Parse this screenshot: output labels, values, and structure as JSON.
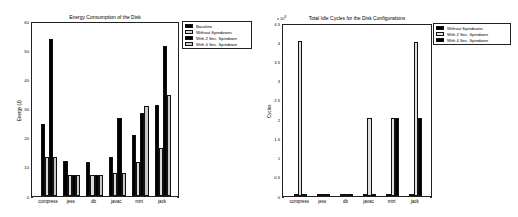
{
  "chart_data": [
    {
      "type": "bar",
      "title": "Energy Consumption of the Disk",
      "xlabel": "",
      "ylabel": "Energy (J)",
      "ylim": [
        0,
        60
      ],
      "yticks": [
        0,
        10,
        20,
        30,
        40,
        50,
        60
      ],
      "grid": false,
      "legend_position": "outside-right-top",
      "categories": [
        "compress",
        "jess",
        "db",
        "javac",
        "mtrt",
        "jack"
      ],
      "series": [
        {
          "name": "Baseline",
          "color": "#000000",
          "values": [
            25,
            12,
            11.7,
            13.3,
            21,
            31.5
          ]
        },
        {
          "name": "Without Spindowns",
          "color": "#d9d9d9",
          "values": [
            13.4,
            7.2,
            7.2,
            7.9,
            11.6,
            16.7
          ]
        },
        {
          "name": "With 2 Sec. Spindown",
          "color": "#000000",
          "values": [
            54,
            7.2,
            7.2,
            27,
            28.7,
            51.8
          ]
        },
        {
          "name": "With 4 Sec. Spindown",
          "color": "#c8c8c8",
          "values": [
            13.4,
            7.2,
            7.2,
            7.9,
            31.2,
            35
          ]
        }
      ]
    },
    {
      "type": "bar",
      "title": "Total Idle Cycles for the Disk Configurations",
      "xlabel": "",
      "ylabel": "Cycles",
      "y_multiplier": "x 10^8",
      "ylim": [
        0,
        4.5
      ],
      "yticks": [
        0,
        0.5,
        1,
        1.5,
        2,
        2.5,
        3,
        3.5,
        4,
        4.5
      ],
      "grid": false,
      "legend_position": "outside-right-top",
      "categories": [
        "compress",
        "jess",
        "db",
        "javac",
        "mtrt",
        "jack"
      ],
      "series": [
        {
          "name": "Without Spindowns",
          "color": "#000000",
          "values": [
            0.03,
            0.06,
            0.03,
            0.04,
            0.03,
            0.02
          ]
        },
        {
          "name": "With 2 Sec. Spindown",
          "color": "#e0e0e0",
          "values": [
            4.05,
            0.06,
            0.03,
            2.05,
            2.05,
            4.04
          ]
        },
        {
          "name": "With 4 Sec. Spindown",
          "color": "#000000",
          "values": [
            0.03,
            0.06,
            0.03,
            0.03,
            2.05,
            2.04
          ]
        }
      ]
    }
  ],
  "left": {
    "title": "Energy Consumption of the Disk",
    "ylabel": "Energy (J)",
    "yticks": [
      "0",
      "10",
      "20",
      "30",
      "40",
      "50",
      "60"
    ],
    "xticks": [
      "compress",
      "jess",
      "db",
      "javac",
      "mtrt",
      "jack"
    ],
    "legend": [
      "Baseline",
      "Without Spindowns",
      "With 2 Sec. Spindown",
      "With 4 Sec. Spindown"
    ]
  },
  "right": {
    "title": "Total Idle Cycles for the Disk Configurations",
    "ylabel": "Cycles",
    "multiplier_base": "x 10",
    "multiplier_exp": "8",
    "yticks": [
      "0",
      "0.5",
      "1",
      "1.5",
      "2",
      "2.5",
      "3",
      "3.5",
      "4",
      "4.5"
    ],
    "xticks": [
      "compress",
      "jess",
      "db",
      "javac",
      "mtrt",
      "jack"
    ],
    "legend": [
      "Without Spindowns",
      "With 2 Sec. Spindown",
      "With 4 Sec. Spindown"
    ]
  }
}
